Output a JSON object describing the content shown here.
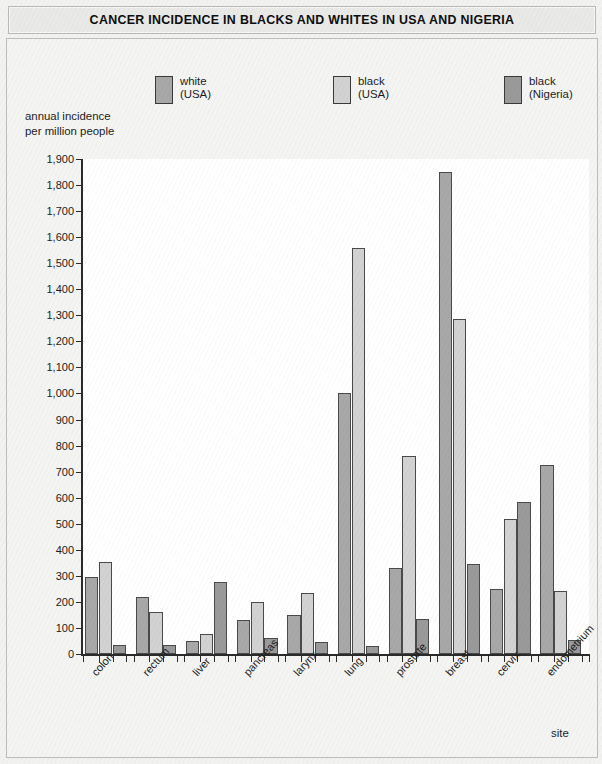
{
  "title": "CANCER INCIDENCE IN BLACKS AND WHITES IN USA AND NIGERIA",
  "legend": [
    {
      "line1": "white",
      "line2": "(USA)",
      "color": "#a8a8a8"
    },
    {
      "line1": "black",
      "line2": "(USA)",
      "color": "#d2d2d2"
    },
    {
      "line1": "black",
      "line2": "(Nigeria)",
      "color": "#9a9a9a"
    }
  ],
  "y_caption": {
    "line1": "annual incidence",
    "line2": "per million people"
  },
  "x_axis_title": "site",
  "chart_data": {
    "type": "bar",
    "title": "CANCER INCIDENCE IN BLACKS AND WHITES IN USA AND NIGERIA",
    "xlabel": "site",
    "ylabel": "annual incidence per million people",
    "ylim": [
      0,
      1900
    ],
    "ytick_step": 100,
    "grid": false,
    "legend_position": "top",
    "ytick_labels": [
      "0",
      "100",
      "200",
      "300",
      "400",
      "500",
      "600",
      "700",
      "800",
      "900",
      "1,000",
      "1,100",
      "1,200",
      "1,300",
      "1,400",
      "1,500",
      "1,600",
      "1,700",
      "1,800",
      "1,900"
    ],
    "categories": [
      "colon",
      "rectum",
      "liver",
      "pancreas",
      "larynx",
      "lung",
      "prostate",
      "breast",
      "cervix",
      "endometrium"
    ],
    "series": [
      {
        "name": "white (USA)",
        "color": "#a8a8a8",
        "values": [
          295,
          220,
          50,
          130,
          150,
          1000,
          330,
          1850,
          250,
          725
        ]
      },
      {
        "name": "black (USA)",
        "color": "#d2d2d2",
        "values": [
          355,
          160,
          75,
          200,
          235,
          1560,
          760,
          1285,
          520,
          240
        ]
      },
      {
        "name": "black (Nigeria)",
        "color": "#9a9a9a",
        "values": [
          35,
          35,
          275,
          60,
          45,
          30,
          135,
          345,
          585,
          55
        ]
      }
    ]
  }
}
